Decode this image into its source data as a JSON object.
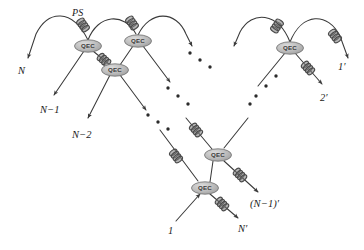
{
  "figure": {
    "type": "schematic-diagram",
    "background_color": "#ffffff",
    "line_color": "#3a3a3a",
    "node_fill": "#b4b4b4",
    "node_stroke": "#6e6e6e",
    "node_text_color": "#3c3c3c",
    "coil_color": "#4a4a4a",
    "dot_color": "#2b2b2b"
  },
  "annotations": {
    "ps_label": "PS"
  },
  "node_label": "QEC",
  "nodes": [
    {
      "id": "qec-1",
      "label": "QEC",
      "x": 88,
      "y": 46
    },
    {
      "id": "qec-2",
      "label": "QEC",
      "x": 138,
      "y": 41
    },
    {
      "id": "qec-3",
      "label": "QEC",
      "x": 115,
      "y": 70
    },
    {
      "id": "qec-4",
      "label": "QEC",
      "x": 290,
      "y": 48
    },
    {
      "id": "qec-5",
      "label": "QEC",
      "x": 218,
      "y": 155
    },
    {
      "id": "qec-6",
      "label": "QEC",
      "x": 205,
      "y": 188
    }
  ],
  "input_labels": [
    {
      "id": "in-N",
      "text": "N",
      "x": 18,
      "y": 66
    },
    {
      "id": "in-N-1",
      "text": "N−1",
      "x": 40,
      "y": 105
    },
    {
      "id": "in-N-2",
      "text": "N−2",
      "x": 72,
      "y": 130
    },
    {
      "id": "in-1",
      "text": "1",
      "x": 168,
      "y": 226
    }
  ],
  "output_labels": [
    {
      "id": "out-1p",
      "text": "1′",
      "x": 338,
      "y": 62
    },
    {
      "id": "out-2p",
      "text": "2′",
      "x": 320,
      "y": 93
    },
    {
      "id": "out-N-1p",
      "text": "(N−1)′",
      "x": 250,
      "y": 199
    },
    {
      "id": "out-Np",
      "text": "N′",
      "x": 238,
      "y": 224
    }
  ],
  "ellipses": [
    {
      "id": "dots-top-right",
      "count": 3,
      "orientation": "diagonal-down-right"
    },
    {
      "id": "dots-mid-center",
      "count": 3,
      "orientation": "diagonal-down-right"
    },
    {
      "id": "dots-left-lower",
      "count": 3,
      "orientation": "diagonal-down-right"
    },
    {
      "id": "dots-right-lower",
      "count": 3,
      "orientation": "diagonal-down-left"
    }
  ],
  "elements": {
    "phase_shifter": "coil-icon",
    "arrowhead": "arrow-icon"
  }
}
